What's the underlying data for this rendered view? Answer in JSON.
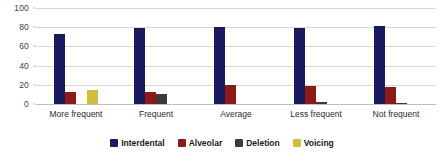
{
  "chart_data": {
    "type": "bar",
    "title": "",
    "subtitle": "",
    "xlabel": "",
    "ylabel": "",
    "ylim": [
      0,
      100
    ],
    "yticks": [
      0,
      20,
      40,
      60,
      80,
      100
    ],
    "grid": true,
    "legend_position": "bottom",
    "categories": [
      "More frequent",
      "Frequent",
      "Average",
      "Less frequent",
      "Not frequent"
    ],
    "series": [
      {
        "name": "Interdental",
        "color": "#1a1a5e",
        "values": [
          73,
          79,
          80,
          79,
          81
        ]
      },
      {
        "name": "Alveolar",
        "color": "#8b1a17",
        "values": [
          13,
          12,
          20,
          19,
          18
        ]
      },
      {
        "name": "Deletion",
        "color": "#3a3a3a",
        "values": [
          0,
          10,
          0,
          2,
          1
        ]
      },
      {
        "name": "Voicing",
        "color": "#d4bc3e",
        "values": [
          15,
          0,
          0,
          0,
          0
        ]
      }
    ]
  },
  "colors": {
    "background": "#ffffff",
    "gridline": "#d9d9d9",
    "axis": "#bfbfbf",
    "tick_text": "#3f3f3f",
    "category_text": "#2b2b2b",
    "legend_text": "#1a1a1a"
  }
}
